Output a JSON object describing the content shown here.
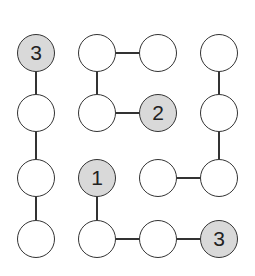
{
  "puzzle": {
    "type": "hashi-like connection grid",
    "grid": {
      "rows": 4,
      "cols": 4
    },
    "nodes": [
      {
        "r": 0,
        "c": 0,
        "label": "3",
        "clue": true
      },
      {
        "r": 0,
        "c": 1,
        "label": "",
        "clue": false
      },
      {
        "r": 0,
        "c": 2,
        "label": "",
        "clue": false
      },
      {
        "r": 0,
        "c": 3,
        "label": "",
        "clue": false
      },
      {
        "r": 1,
        "c": 0,
        "label": "",
        "clue": false
      },
      {
        "r": 1,
        "c": 1,
        "label": "",
        "clue": false
      },
      {
        "r": 1,
        "c": 2,
        "label": "2",
        "clue": true
      },
      {
        "r": 1,
        "c": 3,
        "label": "",
        "clue": false
      },
      {
        "r": 2,
        "c": 0,
        "label": "",
        "clue": false
      },
      {
        "r": 2,
        "c": 1,
        "label": "1",
        "clue": true
      },
      {
        "r": 2,
        "c": 2,
        "label": "",
        "clue": false
      },
      {
        "r": 2,
        "c": 3,
        "label": "",
        "clue": false
      },
      {
        "r": 3,
        "c": 0,
        "label": "",
        "clue": false
      },
      {
        "r": 3,
        "c": 1,
        "label": "",
        "clue": false
      },
      {
        "r": 3,
        "c": 2,
        "label": "",
        "clue": false
      },
      {
        "r": 3,
        "c": 3,
        "label": "3",
        "clue": true
      }
    ],
    "edges": [
      {
        "from": [
          0,
          0
        ],
        "to": [
          1,
          0
        ]
      },
      {
        "from": [
          1,
          0
        ],
        "to": [
          2,
          0
        ]
      },
      {
        "from": [
          2,
          0
        ],
        "to": [
          3,
          0
        ]
      },
      {
        "from": [
          0,
          1
        ],
        "to": [
          0,
          2
        ]
      },
      {
        "from": [
          0,
          1
        ],
        "to": [
          1,
          1
        ]
      },
      {
        "from": [
          1,
          1
        ],
        "to": [
          1,
          2
        ]
      },
      {
        "from": [
          0,
          3
        ],
        "to": [
          1,
          3
        ]
      },
      {
        "from": [
          1,
          3
        ],
        "to": [
          2,
          3
        ]
      },
      {
        "from": [
          2,
          2
        ],
        "to": [
          2,
          3
        ]
      },
      {
        "from": [
          2,
          1
        ],
        "to": [
          3,
          1
        ]
      },
      {
        "from": [
          3,
          1
        ],
        "to": [
          3,
          2
        ]
      },
      {
        "from": [
          3,
          2
        ],
        "to": [
          3,
          3
        ]
      }
    ],
    "colors": {
      "clue_fill": "#d9d9d9",
      "empty_fill": "#ffffff",
      "stroke": "#333333"
    }
  }
}
